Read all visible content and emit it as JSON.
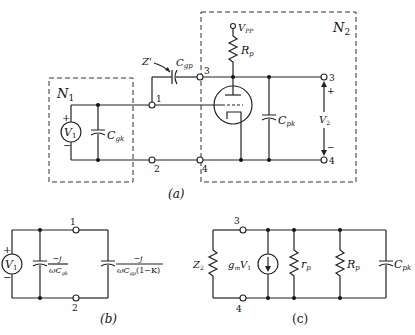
{
  "figure": {
    "a": {
      "caption": "(a)",
      "network1_label": "N",
      "network1_sub": "1",
      "network2_label": "N",
      "network2_sub": "2",
      "source_label": "V",
      "source_sub": "1",
      "source_plus": "+",
      "source_minus": "−",
      "cgk_label": "C",
      "cgk_sub": "gk",
      "cgp_label": "C",
      "cgp_sub": "gp",
      "z_prime_label": "Z'",
      "vpp_label": "V",
      "vpp_sub": "PP",
      "rp_label": "R",
      "rp_sub": "p",
      "cpk_label": "C",
      "cpk_sub": "pk",
      "v2_label": "V",
      "v2_sub": "2",
      "v2_plus": "+",
      "v2_minus": "−",
      "nodes": [
        "1",
        "2",
        "3",
        "4",
        "3",
        "4"
      ]
    },
    "b": {
      "caption": "(b)",
      "source_label": "V",
      "source_sub": "1",
      "plus": "+",
      "minus": "−",
      "node_top": "1",
      "node_bottom": "2",
      "z1_num": "−j",
      "z1_den": "ωC",
      "z1_den_sub": "gk",
      "z2_num": "−j",
      "z2_den": "ωC",
      "z2_den_sub": "gp",
      "z2_den_tail": "(1−K)"
    },
    "c": {
      "caption": "(c)",
      "node_top": "3",
      "node_bottom": "4",
      "z2_label": "Z",
      "z2_sub": "2",
      "gm_label": "g",
      "gm_sub": "m",
      "gm_v": "V",
      "gm_v_sub": "1",
      "rp_small": "r",
      "rp_small_sub": "p",
      "rp_label": "R",
      "rp_sub": "p",
      "cpk_label": "C",
      "cpk_sub": "pk"
    }
  }
}
